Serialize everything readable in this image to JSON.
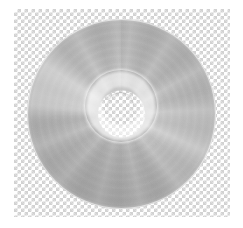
{
  "image": {
    "subject": "optical-disc",
    "description": "CD / DVD optical disc, label side up, on a transparent background",
    "width": 243,
    "height": 228,
    "background_style": "transparency-checkerboard"
  },
  "canvas": {
    "page_background": "#ffffff",
    "checkerboard": {
      "light_color": "#ffffff",
      "dark_color": "#d2d2d2",
      "square_size": 3.5,
      "left": 14,
      "top": 9,
      "width": 216,
      "height": 208
    }
  },
  "disc": {
    "label": "optical-disc",
    "center_x": 121,
    "center_y": 114,
    "outer_radius": 94,
    "body_color": "#b4b4b4",
    "rim_highlight_color": "#cfcfcf",
    "shadow_color": "#9a9a9a",
    "sheen_color": "#ffffff",
    "hub": {
      "label": "clear-plastic-hub",
      "center_x": 121,
      "center_y": 106,
      "radius": 34,
      "color": "#f2f2f2",
      "opacity": 0.6
    },
    "center_hole": {
      "label": "spindle-hole",
      "center_x": 120,
      "center_y": 105,
      "radius": 13,
      "fill": "transparent"
    }
  }
}
